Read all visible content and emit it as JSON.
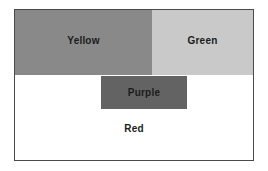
{
  "diagram": {
    "frame": {
      "border_color": "#4a4a4a",
      "background_color": "#ffffff"
    },
    "regions": [
      {
        "name": "yellow",
        "label": "Yellow",
        "fill": "#898989",
        "text_color": "#1b1b1b"
      },
      {
        "name": "green",
        "label": "Green",
        "fill": "#c9c9c9",
        "text_color": "#1b1b1b"
      },
      {
        "name": "purple",
        "label": "Purple",
        "fill": "#636363",
        "text_color": "#1b1b1b"
      },
      {
        "name": "red",
        "label": "Red",
        "fill": "#ffffff",
        "text_color": "#1b1b1b"
      }
    ]
  }
}
